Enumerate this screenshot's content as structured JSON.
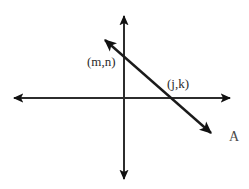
{
  "figure": {
    "background_color": "#ffffff",
    "stroke_color": "#1a1a1a",
    "label_color": "#2b2b2b",
    "width": 249,
    "height": 189,
    "axes": {
      "origin": {
        "x": 124,
        "y": 98
      },
      "horizontal": {
        "name": "x-axis",
        "from": {
          "x": 12,
          "y": 98
        },
        "to": {
          "x": 232,
          "y": 98
        },
        "arrow_both_ends": true
      },
      "vertical": {
        "name": "y-axis",
        "from": {
          "x": 124,
          "y": 14
        },
        "to": {
          "x": 124,
          "y": 181
        },
        "arrow_both_ends": true
      }
    },
    "line": {
      "name": "line-A",
      "from": {
        "x": 103,
        "y": 38
      },
      "to": {
        "x": 213,
        "y": 135
      },
      "arrow_both_ends": true,
      "label": "A"
    },
    "points": [
      {
        "id": "point-mn",
        "label": "(m,n)",
        "description": "intersection of line A with the vertical axis",
        "at": {
          "x": 124,
          "y": 55
        },
        "label_position": {
          "x": 87,
          "y": 55
        }
      },
      {
        "id": "point-jk",
        "label": "(j,k)",
        "description": "intersection of line A with the horizontal axis",
        "at": {
          "x": 184,
          "y": 98
        },
        "label_position": {
          "x": 167,
          "y": 77
        }
      }
    ],
    "line_label": {
      "id": "label-line-a",
      "text": "A",
      "position": {
        "x": 229,
        "y": 130
      }
    }
  }
}
